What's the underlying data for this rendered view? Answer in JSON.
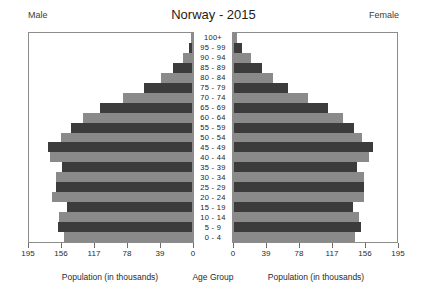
{
  "header": {
    "left_label": "Male",
    "right_label": "Female",
    "title": "Norway - 2015"
  },
  "captions": {
    "left": "Population (in thousands)",
    "center": "Age Group",
    "right": "Population (in thousands)"
  },
  "colors": {
    "bar_dark": "#3c3c3c",
    "bar_light": "#8a8a8a",
    "frame": "#8c8c8c",
    "text": "#1c1c1c",
    "background": "#ffffff"
  },
  "chart_data": {
    "type": "bar",
    "subtype": "population-pyramid",
    "title": "Norway - 2015",
    "xlabel": "Population (in thousands)",
    "ylabel": "Age Group",
    "xlim": [
      0,
      195
    ],
    "grid": false,
    "legend": false,
    "tick_values": [
      195,
      156,
      117,
      78,
      39,
      0
    ],
    "tick_labels_left": [
      "195",
      "156",
      "117",
      "78",
      "39",
      "0"
    ],
    "tick_labels_right": [
      "0",
      "39",
      "78",
      "117",
      "156",
      "195"
    ],
    "categories": [
      "100+",
      "95 - 99",
      "90 - 94",
      "85 - 89",
      "80 - 84",
      "75 - 79",
      "70 - 74",
      "65 - 69",
      "60 - 64",
      "55 - 59",
      "50 - 54",
      "45 - 49",
      "40 - 44",
      "35 - 39",
      "30 - 34",
      "25 - 29",
      "20 - 24",
      "15 - 19",
      "10 - 14",
      "5 - 9",
      "0 - 4"
    ],
    "series": [
      {
        "name": "Male",
        "side": "left",
        "values": [
          1,
          4,
          11,
          23,
          37,
          57,
          83,
          110,
          131,
          145,
          157,
          172,
          170,
          155,
          163,
          163,
          167,
          150,
          159,
          160,
          153
        ]
      },
      {
        "name": "Female",
        "side": "right",
        "values": [
          3,
          9,
          20,
          34,
          47,
          65,
          88,
          112,
          130,
          143,
          153,
          166,
          162,
          147,
          155,
          155,
          156,
          142,
          150,
          152,
          145
        ]
      }
    ]
  }
}
